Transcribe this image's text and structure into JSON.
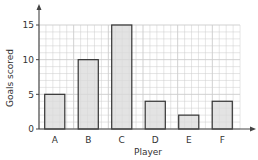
{
  "chart_data": {
    "type": "bar",
    "title": "",
    "xlabel": "Player",
    "ylabel": "Goals scored",
    "categories": [
      "A",
      "B",
      "C",
      "D",
      "E",
      "F"
    ],
    "values": [
      5,
      10,
      15,
      4,
      2,
      4
    ],
    "ylim": [
      0,
      15
    ],
    "yticks": [
      0,
      5,
      10,
      15
    ],
    "grid": true,
    "grid_minor_step": 1,
    "legend": null
  },
  "colors": {
    "bar_fill": "#d9d9d9",
    "bar_stroke": "#333333",
    "grid": "#cccccc",
    "axis": "#444444"
  }
}
